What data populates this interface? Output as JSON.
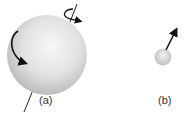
{
  "figure": {
    "panels": [
      {
        "id": "a",
        "label": "(a)",
        "description": "large sphere with spin axis and rotation arrows"
      },
      {
        "id": "b",
        "label": "(b)",
        "description": "small sphere with arrow vector"
      }
    ],
    "colors": {
      "sphere_light": "#f4f4f4",
      "sphere_dark": "#b8b8b8",
      "arrow": "#111111",
      "label_text": "#333333"
    }
  }
}
